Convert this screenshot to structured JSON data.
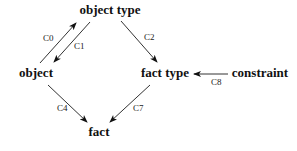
{
  "diagram": {
    "nodes": [
      {
        "id": "object_type",
        "label": "object type",
        "x": 110,
        "y": 14
      },
      {
        "id": "object",
        "label": "object",
        "x": 36,
        "y": 77
      },
      {
        "id": "fact_type",
        "label": "fact type",
        "x": 165,
        "y": 77
      },
      {
        "id": "constraint",
        "label": "constraint",
        "x": 260,
        "y": 77
      },
      {
        "id": "fact",
        "label": "fact",
        "x": 99,
        "y": 136
      }
    ],
    "edges": [
      {
        "id": "c0",
        "label": "C0",
        "from": "object",
        "to": "object_type",
        "x1": 40,
        "y1": 63,
        "x2": 76,
        "y2": 23,
        "lx": 43,
        "ly": 41
      },
      {
        "id": "c1",
        "label": "C1",
        "from": "object_type",
        "to": "object",
        "x1": 90,
        "y1": 22,
        "x2": 54,
        "y2": 62,
        "lx": 74,
        "ly": 49
      },
      {
        "id": "c2",
        "label": "C2",
        "from": "object_type",
        "to": "fact_type",
        "x1": 121,
        "y1": 21,
        "x2": 157,
        "y2": 62,
        "lx": 144,
        "ly": 40
      },
      {
        "id": "c8",
        "label": "C8",
        "from": "constraint",
        "to": "fact_type",
        "x1": 228,
        "y1": 74,
        "x2": 194,
        "y2": 74,
        "lx": 211,
        "ly": 85
      },
      {
        "id": "c4",
        "label": "C4",
        "from": "object",
        "to": "fact",
        "x1": 48,
        "y1": 85,
        "x2": 87,
        "y2": 122,
        "lx": 57,
        "ly": 111
      },
      {
        "id": "c7",
        "label": "C7",
        "from": "fact_type",
        "to": "fact",
        "x1": 150,
        "y1": 85,
        "x2": 110,
        "y2": 122,
        "lx": 133,
        "ly": 111
      }
    ]
  }
}
